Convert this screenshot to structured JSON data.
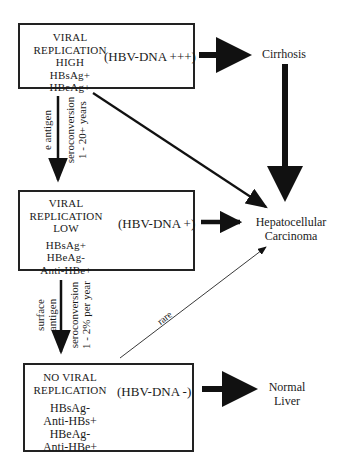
{
  "diagram": {
    "boxes": [
      {
        "id": "high-replication",
        "stage_lines": [
          "VIRAL",
          "REPLICATION",
          "HIGH"
        ],
        "markers": [
          "HBsAg+",
          "HBeAg+"
        ],
        "hbv_dna": "(HBV-DNA +++)"
      },
      {
        "id": "low-replication",
        "stage_lines": [
          "VIRAL",
          "REPLICATION",
          "LOW"
        ],
        "markers": [
          "HBsAg+",
          "HBeAg-",
          "Anti-HBe+"
        ],
        "hbv_dna": "(HBV-DNA +)"
      },
      {
        "id": "no-replication",
        "stage_lines": [
          "NO VIRAL",
          "REPLICATION"
        ],
        "markers": [
          "HBsAg-",
          "Anti-HBs+",
          "HBeAg-",
          "Anti-HBe+"
        ],
        "hbv_dna": "(HBV-DNA -)"
      }
    ],
    "outcomes": {
      "cirrhosis": "Cirrhosis",
      "hcc_line1": "Hepatocellular",
      "hcc_line2": "Carcinoma",
      "normal_line1": "Normal",
      "normal_line2": "Liver"
    },
    "transitions": [
      {
        "antigen_line1": "",
        "antigen_line2": "e antigen",
        "seroconversion": "seroconversion",
        "rate": "1 - 20+ years"
      },
      {
        "antigen_line1": "surface",
        "antigen_line2": "antigen",
        "seroconversion": "seroconversion",
        "rate": "1 - 2% per year"
      }
    ],
    "rare_label": "rare"
  }
}
